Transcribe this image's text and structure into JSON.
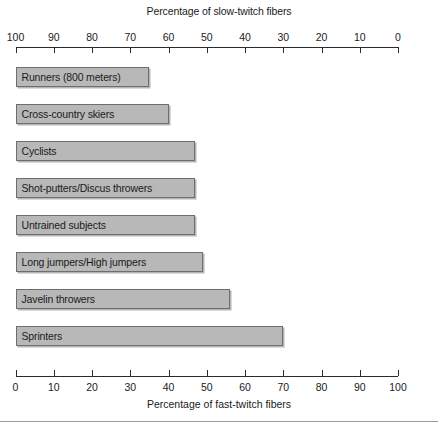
{
  "chart_data": {
    "type": "bar",
    "orientation": "horizontal",
    "title": "",
    "top_axis": {
      "label": "Percentage of slow-twitch fibers",
      "ticks": [
        100,
        90,
        80,
        70,
        60,
        50,
        40,
        30,
        20,
        10,
        0
      ],
      "range": [
        100,
        0
      ],
      "direction": "reversed"
    },
    "bottom_axis": {
      "label": "Percentage of fast-twitch fibers",
      "ticks": [
        0,
        10,
        20,
        30,
        40,
        50,
        60,
        70,
        80,
        90,
        100
      ],
      "range": [
        0,
        100
      ],
      "direction": "normal"
    },
    "xlabel": "Percentage of fast-twitch fibers",
    "ylabel": "",
    "xlim": [
      0,
      100
    ],
    "grid": false,
    "legend": false,
    "categories": [
      "Runners (800 meters)",
      "Cross-country skiers",
      "Cyclists",
      "Shot-putters/Discus throwers",
      "Untrained subjects",
      "Long jumpers/High jumpers",
      "Javelin throwers",
      "Sprinters"
    ],
    "values": [
      35,
      40,
      47,
      47,
      47,
      49,
      56,
      70
    ],
    "series": [
      {
        "name": "Percentage of fast-twitch fibers",
        "values": [
          35,
          40,
          47,
          47,
          47,
          49,
          56,
          70
        ]
      }
    ],
    "bars": [
      {
        "label": "Runners (800 meters)",
        "fast_twitch": 35,
        "slow_twitch": 65
      },
      {
        "label": "Cross-country skiers",
        "fast_twitch": 40,
        "slow_twitch": 60
      },
      {
        "label": "Cyclists",
        "fast_twitch": 47,
        "slow_twitch": 53
      },
      {
        "label": "Shot-putters/Discus throwers",
        "fast_twitch": 47,
        "slow_twitch": 53
      },
      {
        "label": "Untrained subjects",
        "fast_twitch": 47,
        "slow_twitch": 53
      },
      {
        "label": "Long jumpers/High jumpers",
        "fast_twitch": 49,
        "slow_twitch": 51
      },
      {
        "label": "Javelin throwers",
        "fast_twitch": 56,
        "slow_twitch": 44
      },
      {
        "label": "Sprinters",
        "fast_twitch": 70,
        "slow_twitch": 30
      }
    ],
    "colors": {
      "bar_fill": "#b8b8b8",
      "bar_border": "#6e6e6e",
      "axis": "#2b2b2b",
      "text": "#1b1b1b",
      "background": "#ffffff"
    }
  }
}
